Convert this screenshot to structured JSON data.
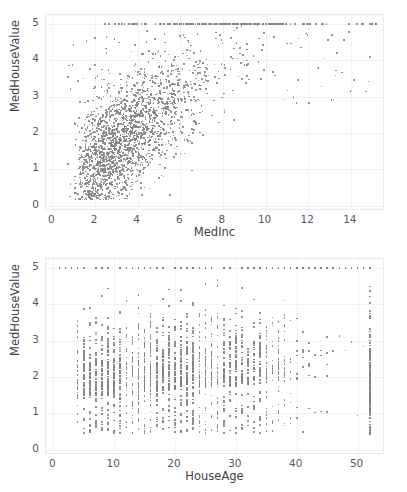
{
  "figure": {
    "background_color": "#ffffff",
    "point_color": "#808085",
    "grid_color": "#f2f2f5",
    "axis_color": "#eaeaee",
    "text_color": "#57575c"
  },
  "chart_data": [
    {
      "type": "scatter",
      "title": "",
      "xlabel": "MedInc",
      "ylabel": "MedHouseValue",
      "xlim": [
        -0.3,
        15.6
      ],
      "ylim": [
        -0.15,
        5.25
      ],
      "xticks": [
        0,
        2,
        4,
        6,
        8,
        10,
        12,
        14
      ],
      "xticklabels": [
        "0",
        "2",
        "4",
        "6",
        "8",
        "10",
        "12",
        "14"
      ],
      "yticks": [
        0,
        1,
        2,
        3,
        4,
        5
      ],
      "yticklabels": [
        "0",
        "1",
        "2",
        "3",
        "4",
        "5"
      ],
      "grid": true,
      "legend": "none",
      "marker_size": 1.6,
      "description": "MedHouseValue versus MedInc; positive correlation, dense cloud at low income, censoring band of points at MedHouseValue = 5.00001",
      "correlation": 0.69,
      "n_points": 2000,
      "x_stats": {
        "mean": 3.87,
        "std": 1.9,
        "min": 0.5,
        "max": 15.0
      },
      "y_stats": {
        "mean": 2.07,
        "std": 1.15,
        "min": 0.15,
        "max": 5.0
      },
      "censored_value": 5.0,
      "censored_fraction": 0.045
    },
    {
      "type": "scatter",
      "title": "",
      "xlabel": "HouseAge",
      "ylabel": "MedHouseValue",
      "xlim": [
        -1.2,
        54.5
      ],
      "ylim": [
        -0.15,
        5.25
      ],
      "xticks": [
        0,
        10,
        20,
        30,
        40,
        50
      ],
      "xticklabels": [
        "0",
        "10",
        "20",
        "30",
        "40",
        "50"
      ],
      "yticks": [
        0,
        1,
        2,
        3,
        4,
        5
      ],
      "yticklabels": [
        "0",
        "1",
        "2",
        "3",
        "4",
        "5"
      ],
      "grid": true,
      "legend": "none",
      "marker_size": 1.6,
      "description": "MedHouseValue versus HouseAge; HouseAge is integer-valued producing vertical striping, weak correlation, dense vertical column at HouseAge = 52 (top-coded)",
      "correlation": 0.1,
      "n_points": 2000,
      "x_stats": {
        "mean": 28.6,
        "std": 12.6,
        "min": 1,
        "max": 52
      },
      "y_stats": {
        "mean": 2.07,
        "std": 1.15,
        "min": 0.15,
        "max": 5.0
      },
      "censored_value": 5.0,
      "censored_fraction": 0.045,
      "x_topcoded": 52
    }
  ]
}
